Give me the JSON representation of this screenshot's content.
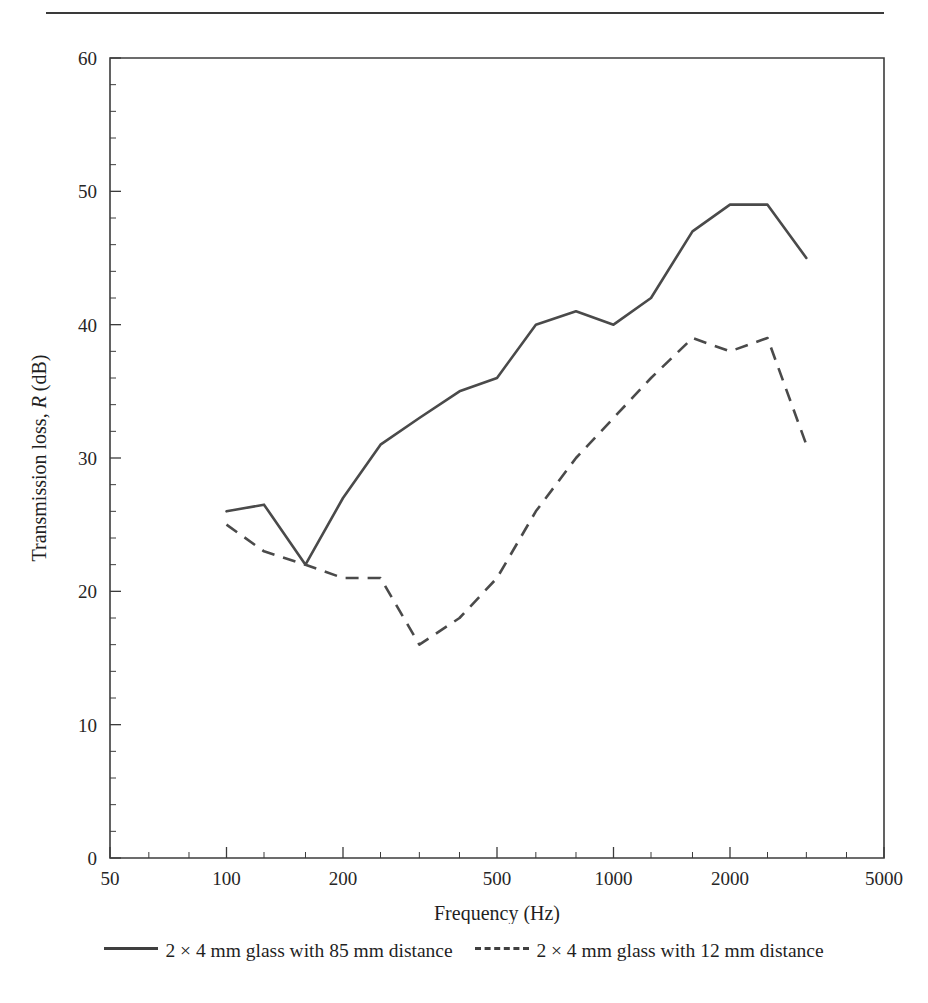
{
  "figure": {
    "has_top_rule": true
  },
  "chart_data": {
    "type": "line",
    "title": "",
    "xlabel": "Frequency (Hz)",
    "ylabel_prefix": "Transmission loss, ",
    "ylabel_italic": "R",
    "ylabel_suffix": " (dB)",
    "ylabel_full": "Transmission loss, R (dB)",
    "xscale": "log",
    "xlim": [
      50,
      5000
    ],
    "ylim": [
      0,
      60
    ],
    "grid": false,
    "legend_position": "below-axes",
    "x_ticks": [
      50,
      100,
      200,
      500,
      1000,
      2000,
      5000
    ],
    "x_tick_labels": [
      "50",
      "100",
      "200",
      "500",
      "1000",
      "2000",
      "5000"
    ],
    "x_minor_ticks": [
      63,
      80,
      125,
      160,
      250,
      315,
      400,
      630,
      800,
      1250,
      1600,
      2500,
      3150,
      4000
    ],
    "y_ticks": [
      0,
      10,
      20,
      30,
      40,
      50,
      60
    ],
    "y_tick_labels": [
      "0",
      "10",
      "20",
      "30",
      "40",
      "50",
      "60"
    ],
    "y_minor_step": 2,
    "series": [
      {
        "name": "2 × 4 mm glass with 85 mm distance",
        "style": "solid",
        "color": "#4a4a4a",
        "x": [
          100,
          125,
          160,
          200,
          250,
          315,
          400,
          500,
          630,
          800,
          1000,
          1250,
          1600,
          2000,
          2500,
          3150
        ],
        "values": [
          26,
          26.5,
          22,
          27,
          31,
          33,
          35,
          36,
          40,
          41,
          40,
          42,
          47,
          49,
          49,
          45
        ]
      },
      {
        "name": "2 × 4 mm glass with 12 mm distance",
        "style": "dashed",
        "color": "#4a4a4a",
        "x": [
          100,
          125,
          160,
          200,
          250,
          315,
          400,
          500,
          630,
          800,
          1000,
          1250,
          1600,
          2000,
          2500,
          3150
        ],
        "values": [
          25,
          23,
          22,
          21,
          21,
          16,
          18,
          21,
          26,
          30,
          33,
          36,
          39,
          38,
          39,
          31
        ]
      }
    ]
  },
  "legend": {
    "entries": [
      {
        "label": "2 × 4 mm glass with 85 mm distance",
        "style": "solid"
      },
      {
        "label": "2 × 4 mm glass with 12 mm distance",
        "style": "dashed"
      }
    ]
  }
}
